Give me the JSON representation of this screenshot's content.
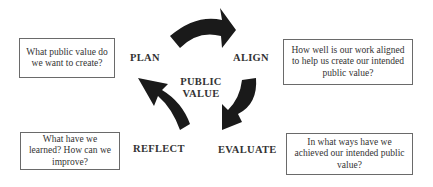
{
  "diagram": {
    "center": {
      "line1": "PUBLIC",
      "line2": "VALUE"
    },
    "stages": {
      "plan": {
        "label": "PLAN",
        "question": "What public value do we want to create?"
      },
      "align": {
        "label": "ALIGN",
        "question": "How well is our work aligned to help us create our intended public value?"
      },
      "evaluate": {
        "label": "EVALUATE",
        "question": "In what ways have we achieved our intended public value?"
      },
      "reflect": {
        "label": "REFLECT",
        "question": "What have we learned? How can we improve?"
      }
    },
    "arrow_color": "#1a1a1a",
    "box_border_color": "#6a6a6a"
  }
}
